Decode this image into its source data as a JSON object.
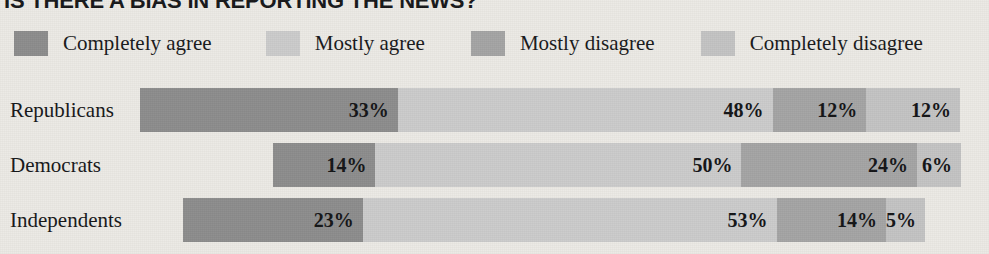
{
  "title": "IS THERE A BIAS IN REPORTING THE NEWS?",
  "legend": {
    "items": [
      {
        "label": "Completely agree",
        "color": "#8d8d8d"
      },
      {
        "label": "Mostly agree",
        "color": "#cccccc"
      },
      {
        "label": "Mostly disagree",
        "color": "#a5a5a5"
      },
      {
        "label": "Completely disagree",
        "color": "#c4c4c4"
      }
    ]
  },
  "rows": [
    {
      "label": "Republicans",
      "values": [
        "33%",
        "48%",
        "12%",
        "12%"
      ]
    },
    {
      "label": "Democrats",
      "values": [
        "14%",
        "50%",
        "24%",
        "6%"
      ]
    },
    {
      "label": "Independents",
      "values": [
        "23%",
        "53%",
        "14%",
        "5%"
      ]
    }
  ],
  "chart_data": {
    "type": "bar",
    "subtype": "stacked-horizontal-100pct",
    "title": "IS THERE A BIAS IN REPORTING THE NEWS?",
    "xlabel": "",
    "ylabel": "",
    "xlim": [
      0,
      100
    ],
    "grid": false,
    "legend_position": "top",
    "value_suffix": "%",
    "categories": [
      "Republicans",
      "Democrats",
      "Independents"
    ],
    "series": [
      {
        "name": "Completely agree",
        "color": "#8d8d8d",
        "values": [
          33,
          14,
          23
        ]
      },
      {
        "name": "Mostly agree",
        "color": "#cccccc",
        "values": [
          48,
          50,
          53
        ]
      },
      {
        "name": "Mostly disagree",
        "color": "#a5a5a5",
        "values": [
          12,
          24,
          14
        ]
      },
      {
        "name": "Completely disagree",
        "color": "#c4c4c4",
        "values": [
          12,
          6,
          5
        ]
      }
    ],
    "bar_geometry_px": [
      {
        "category": "Republicans",
        "left": 140,
        "width": 820
      },
      {
        "category": "Democrats",
        "left": 273,
        "width": 688
      },
      {
        "category": "Independents",
        "left": 183,
        "width": 742
      }
    ]
  }
}
